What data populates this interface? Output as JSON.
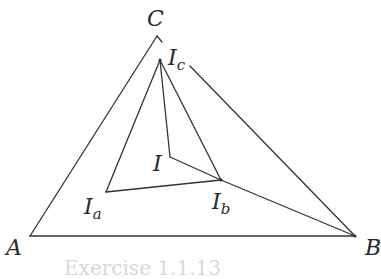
{
  "figure": {
    "stroke_color": "#333333",
    "points": {
      "A": {
        "label": "A",
        "sub": "",
        "x": 30,
        "y": 236
      },
      "B": {
        "label": "B",
        "sub": "",
        "x": 355,
        "y": 236
      },
      "C": {
        "label": "C",
        "sub": "",
        "x": 157,
        "y": 36
      },
      "Ic": {
        "label": "I",
        "sub": "c",
        "x": 160,
        "y": 60
      },
      "I": {
        "label": "I",
        "sub": "",
        "x": 170,
        "y": 157
      },
      "Ia": {
        "label": "I",
        "sub": "a",
        "x": 106,
        "y": 192
      },
      "Ib": {
        "label": "I",
        "sub": "b",
        "x": 221,
        "y": 180
      }
    },
    "segments": [
      [
        "A",
        "B"
      ],
      [
        "A",
        "C"
      ],
      [
        "C",
        "B"
      ],
      [
        "Ic",
        "Ia"
      ],
      [
        "Ic",
        "I"
      ],
      [
        "Ic",
        "Ib"
      ],
      [
        "Ia",
        "Ib"
      ],
      [
        "I",
        "Ib"
      ],
      [
        "Ib",
        "B"
      ]
    ],
    "caption": "Exercise 1.1.13"
  }
}
